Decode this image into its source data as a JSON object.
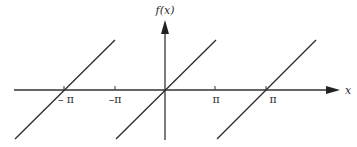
{
  "diagram": {
    "axes": {
      "x_label": "x",
      "y_label": "f(x)",
      "color": "#333333"
    },
    "ticks": [
      {
        "label": "– π",
        "px": 64
      },
      {
        "label": "–π",
        "px": 115
      },
      {
        "label": "π",
        "px": 215
      },
      {
        "label": "π",
        "px": 266
      }
    ],
    "segments": [
      {
        "x1": 15,
        "y1": 139,
        "x2": 115,
        "y2": 40
      },
      {
        "x1": 116,
        "y1": 139,
        "x2": 216,
        "y2": 40
      },
      {
        "x1": 217,
        "y1": 139,
        "x2": 316,
        "y2": 40
      }
    ]
  }
}
